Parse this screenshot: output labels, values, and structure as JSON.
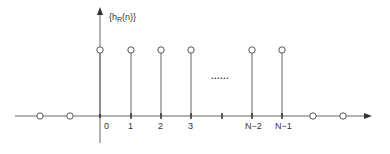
{
  "diagram": {
    "y_label_main": "{h",
    "y_label_sub": "R",
    "y_label_rest": "(n)}",
    "ellipsis": "......",
    "colors": {
      "line": "#555555",
      "circle_fill": "#ffffff",
      "text": "#333333"
    },
    "stems": [
      {
        "label": "0",
        "x": 100
      },
      {
        "label": "1",
        "x": 131
      },
      {
        "label": "2",
        "x": 161
      },
      {
        "label": "3",
        "x": 191
      },
      {
        "label": "N−2",
        "x": 252
      },
      {
        "label": "N−1",
        "x": 282
      }
    ],
    "blank_tick_x": 222,
    "zero_samples_left": [
      40,
      70
    ],
    "zero_samples_right": [
      313,
      343
    ]
  }
}
